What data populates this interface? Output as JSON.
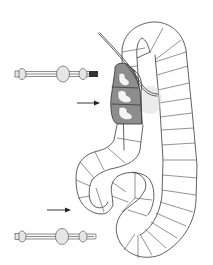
{
  "figure": {
    "colors": {
      "background": "#ffffff",
      "outline": "#3a3a3a",
      "shading": "#8d8d8d"
    },
    "elements": [
      {
        "name": "upper-bolt",
        "position": "top-left"
      },
      {
        "name": "upper-arrow",
        "direction": "right",
        "target": "shaded-segment-cluster"
      },
      {
        "name": "shaded-segment-cluster",
        "segments": 3
      },
      {
        "name": "thread",
        "position": "top, passing through cluster"
      },
      {
        "name": "segmented-tube",
        "shape": "S-shaped loop"
      },
      {
        "name": "lower-arrow",
        "direction": "right",
        "target": "lower-bend"
      },
      {
        "name": "lower-bolt",
        "position": "bottom-left"
      }
    ]
  }
}
